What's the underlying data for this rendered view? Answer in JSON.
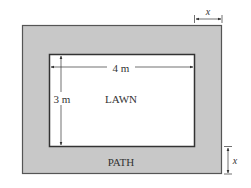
{
  "diagram": {
    "inner": {
      "label": "LAWN",
      "width_label": "4 m",
      "height_label": "3 m"
    },
    "outer": {
      "label": "PATH"
    },
    "path_width_label": "x",
    "colors": {
      "path_fill": "#c8c8c8",
      "lawn_fill": "#ffffff",
      "stroke": "#333333"
    }
  }
}
